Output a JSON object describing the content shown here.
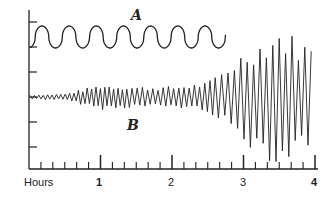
{
  "chart_data": {
    "type": "line",
    "title": "",
    "xlabel": "Hours",
    "ylabel": "Centimeters",
    "x_ticks": [
      "1",
      "2",
      "3",
      "4"
    ],
    "x_range": [
      0,
      4
    ],
    "minor_ticks_per_hour": 6,
    "y_ticks_count": 6,
    "grid": false,
    "legend": "none",
    "series": [
      {
        "name": "A",
        "description": "Regular square-like oscillation, approx 7 cycles over ~2.7 hours, steady amplitude",
        "x_end_hours": 2.75,
        "period_hours": 0.38,
        "amplitude_cm_relative": 1.0
      },
      {
        "name": "B",
        "description": "Irregular oscillation with growing amplitude: small (0–1.4h), moderate (1.4–2.6h), large burst peaking near 3.5h",
        "x_end_hours": 4.0,
        "amplitude_profile": [
          {
            "hours": 0.0,
            "amplitude": 0.1
          },
          {
            "hours": 0.5,
            "amplitude": 0.15
          },
          {
            "hours": 1.0,
            "amplitude": 0.6
          },
          {
            "hours": 1.5,
            "amplitude": 0.5
          },
          {
            "hours": 2.0,
            "amplitude": 0.5
          },
          {
            "hours": 2.5,
            "amplitude": 0.7
          },
          {
            "hours": 3.0,
            "amplitude": 2.2
          },
          {
            "hours": 3.5,
            "amplitude": 3.3
          },
          {
            "hours": 4.0,
            "amplitude": 2.4
          }
        ]
      }
    ],
    "annotations": [
      "A",
      "B"
    ]
  },
  "labels": {
    "xlabel": "Hours",
    "ylabel": "Centimeters",
    "tick1": "1",
    "tick2": "2",
    "tick3": "3",
    "tick4": "4",
    "seriesA": "A",
    "seriesB": "B"
  }
}
